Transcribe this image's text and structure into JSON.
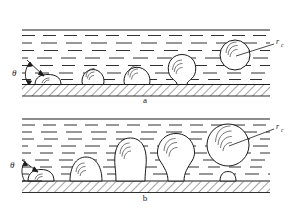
{
  "figure": {
    "type": "scientific-diagram",
    "background_color": "#ffffff",
    "line_color": "#1a1a1a",
    "panels": [
      {
        "id": "a",
        "label": "a",
        "contact_angle_symbol": "θ",
        "radius_symbol": "r",
        "radius_subscript": "c",
        "stages": [
          {
            "name": "flattened-nucleus",
            "shape": "oblate",
            "cx": 48,
            "cy": 79,
            "rx": 13,
            "ry": 5
          },
          {
            "name": "growing-bubble-1",
            "shape": "near-sphere",
            "cx": 93,
            "cy": 72,
            "r": 11
          },
          {
            "name": "growing-bubble-2",
            "shape": "near-sphere",
            "cx": 137,
            "cy": 70,
            "r": 13
          },
          {
            "name": "necking-bubble",
            "shape": "pinching",
            "cx": 182,
            "cy": 68,
            "r": 14
          },
          {
            "name": "departed-bubble",
            "shape": "sphere",
            "cx": 235,
            "cy": 55,
            "r": 15
          }
        ]
      },
      {
        "id": "b",
        "label": "b",
        "contact_angle_symbol": "θ",
        "radius_symbol": "r",
        "radius_subscript": "c",
        "stages": [
          {
            "name": "flattened-nucleus",
            "shape": "oblate",
            "cx": 40,
            "cy": 174,
            "rx": 12,
            "ry": 6
          },
          {
            "name": "growing-bubble-1",
            "shape": "dome",
            "cx": 86,
            "cy": 168,
            "r": 13
          },
          {
            "name": "growing-bubble-2",
            "shape": "stemmed",
            "cx": 130,
            "cy": 158,
            "r": 17
          },
          {
            "name": "necking-bubble",
            "shape": "stemmed-narrow",
            "cx": 176,
            "cy": 152,
            "r": 18
          },
          {
            "name": "departed-bubble",
            "shape": "sphere",
            "cx": 228,
            "cy": 145,
            "r": 21
          },
          {
            "name": "residual-nucleus",
            "shape": "small-dome",
            "cx": 228,
            "cy": 181,
            "r": 7
          }
        ]
      }
    ],
    "liquid_region": {
      "representation": "horizontal dashed strokes",
      "boundary": "solid horizontal line at top"
    },
    "wall_region": {
      "representation": "diagonal cross-hatching",
      "label": "heated solid surface"
    }
  }
}
